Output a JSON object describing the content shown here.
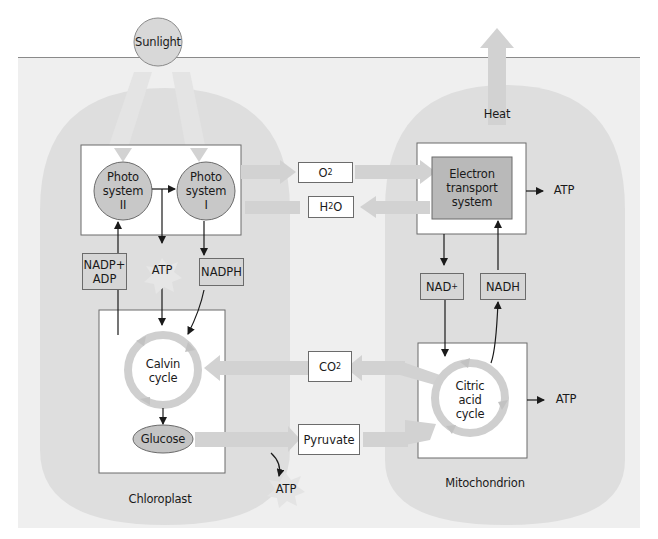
{
  "diagram": {
    "type": "metabolic-pathway",
    "colors": {
      "panel_background": "#efefef",
      "organelle_fill": "#dedede",
      "flow_arrow": "#d2d2d2",
      "circle_fill": "#c8c8c8",
      "ets_box_fill": "#b9b9b9",
      "label_box_fill": "#d6d6d6",
      "line": "#1a1a1a"
    },
    "top": {
      "sunlight": "Sunlight",
      "heat": "Heat"
    },
    "chloroplast": {
      "label": "Chloroplast",
      "photosystem_2": [
        "Photo",
        "system",
        "II"
      ],
      "photosystem_1": [
        "Photo",
        "system",
        "I"
      ],
      "inputs_box": [
        "NADP+",
        "ADP"
      ],
      "atp": "ATP",
      "nadph": "NADPH",
      "calvin_cycle": [
        "Calvin",
        "cycle"
      ],
      "glucose": "Glucose"
    },
    "exchange": {
      "o2": {
        "base": "O",
        "sub": "2"
      },
      "h2o": {
        "pre": "H",
        "sub": "2",
        "post": "O"
      },
      "co2": {
        "base": "CO",
        "sub": "2"
      },
      "pyruvate": "Pyruvate",
      "glycolysis_atp": "ATP"
    },
    "mitochondrion": {
      "label": "Mitochondrion",
      "ets": [
        "Electron",
        "transport",
        "system"
      ],
      "ets_atp": "ATP",
      "nad": {
        "base": "NAD",
        "sup": "+"
      },
      "nadh": "NADH",
      "citric_cycle": [
        "Citric",
        "acid",
        "cycle"
      ],
      "citric_atp": "ATP"
    }
  }
}
